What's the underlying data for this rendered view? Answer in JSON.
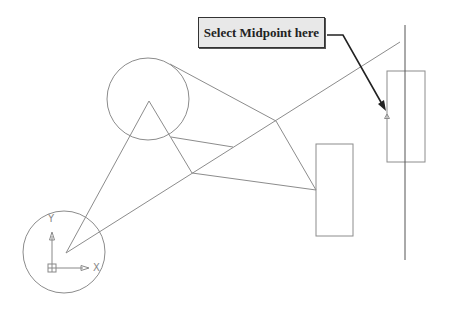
{
  "callout": {
    "label": "Select Midpoint here"
  },
  "ucs": {
    "x_label": "X",
    "y_label": "Y"
  },
  "colors": {
    "geometry": "#8c8c8c",
    "leader": "#222222",
    "callout_fill": "#e8e8e8"
  },
  "geometry": {
    "circles": [
      {
        "name": "upper-circle",
        "cx": 148,
        "cy": 99,
        "r": 41
      },
      {
        "name": "lower-circle",
        "cx": 64,
        "cy": 252,
        "r": 41
      }
    ],
    "rectangles": [
      {
        "name": "middle-rectangle",
        "x": 316,
        "y": 144,
        "w": 37,
        "h": 92
      },
      {
        "name": "right-rectangle",
        "x": 387,
        "y": 71,
        "w": 38,
        "h": 91
      }
    ],
    "vertical_line": {
      "x": 405,
      "y1": 25,
      "y2": 260
    },
    "midpoint_marker": {
      "x": 387,
      "y": 116
    }
  }
}
